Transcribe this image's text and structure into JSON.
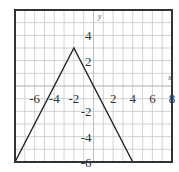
{
  "chart_data": {
    "type": "line",
    "title": "",
    "xlabel": "x",
    "ylabel": "y",
    "xlim": [
      -8,
      8
    ],
    "ylim": [
      -6,
      6
    ],
    "grid": true,
    "x_ticks": [
      -6,
      -4,
      -2,
      2,
      4,
      6,
      8
    ],
    "y_ticks": [
      4,
      2,
      -2,
      -4,
      -6
    ],
    "x_tick_labels": [
      "-6",
      "-4",
      "-2",
      "2",
      "4",
      "6",
      "8"
    ],
    "y_tick_labels": [
      "4",
      "2",
      "-2",
      "-4",
      "-6"
    ],
    "series": [
      {
        "name": "y = -1.5|x + 2| + 3",
        "x": [
          -8,
          -2,
          4
        ],
        "y": [
          -6,
          3,
          -6
        ],
        "color": "#222222"
      }
    ]
  }
}
